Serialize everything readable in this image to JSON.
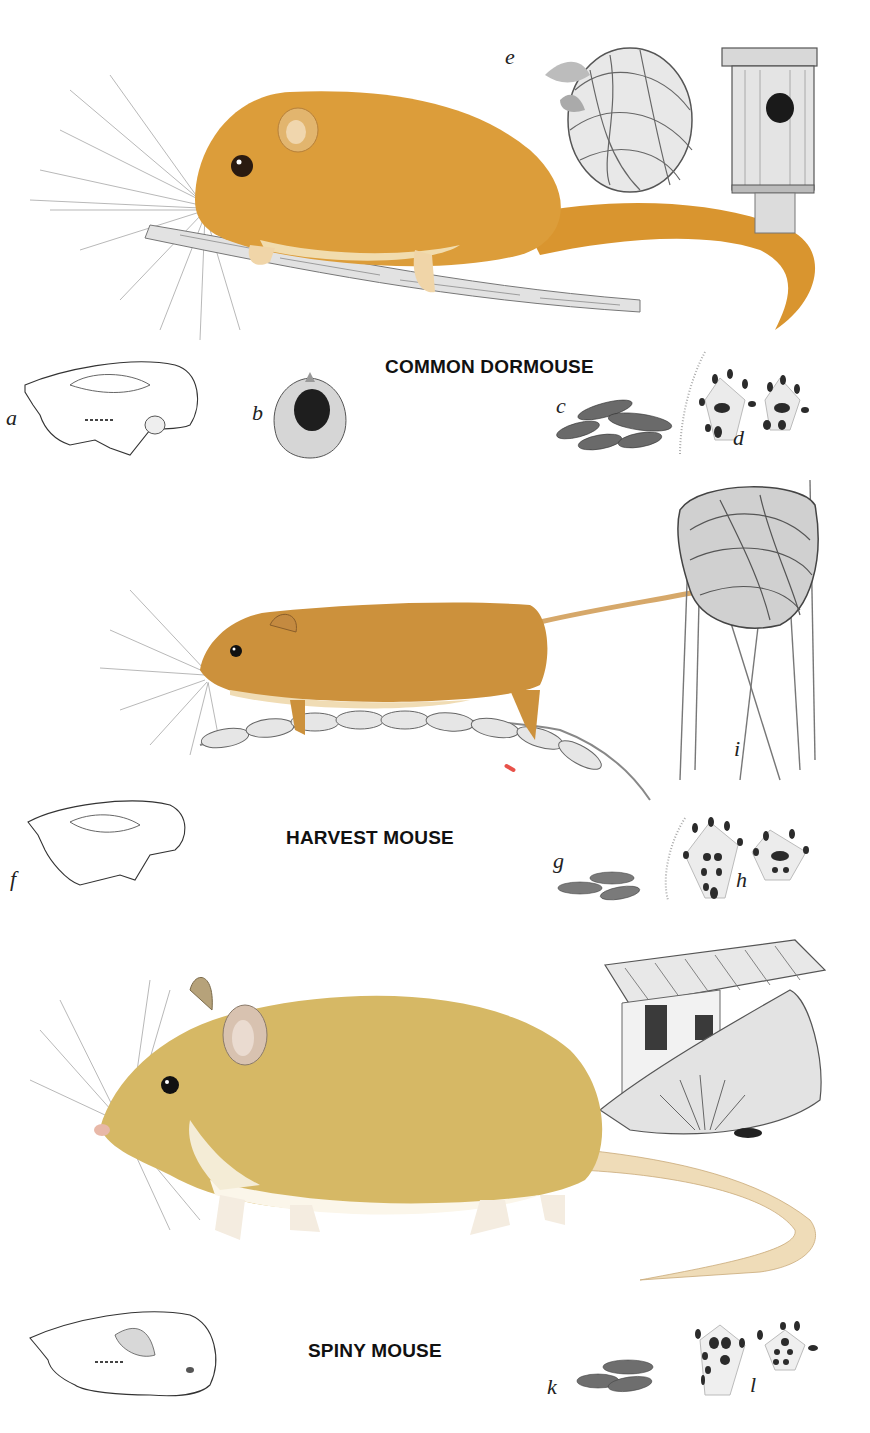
{
  "plate": {
    "background": "#ffffff",
    "sections": [
      {
        "species": "COMMON DORMOUSE",
        "fur_color": "#d99a35",
        "figures": {
          "a": {
            "letter": "a",
            "subject": "skull"
          },
          "b": {
            "letter": "b",
            "subject": "gnawed hazelnut"
          },
          "c": {
            "letter": "c",
            "subject": "droppings"
          },
          "d": {
            "letter": "d",
            "subject": "footprints"
          },
          "e": {
            "letter": "e",
            "subject": "nest and nest box"
          }
        }
      },
      {
        "species": "HARVEST MOUSE",
        "fur_color": "#c98f3c",
        "figures": {
          "f": {
            "letter": "f",
            "subject": "skull"
          },
          "g": {
            "letter": "g",
            "subject": "droppings"
          },
          "h": {
            "letter": "h",
            "subject": "footprints"
          },
          "i": {
            "letter": "i",
            "subject": "woven grass nest"
          }
        }
      },
      {
        "species": "SPINY MOUSE",
        "fur_color": "#d4b45c",
        "figures": {
          "k": {
            "letter": "k",
            "subject": "droppings"
          },
          "l": {
            "letter": "l",
            "subject": "footprints"
          },
          "habitat": {
            "subject": "rocky wall and tiled building"
          }
        }
      }
    ]
  }
}
